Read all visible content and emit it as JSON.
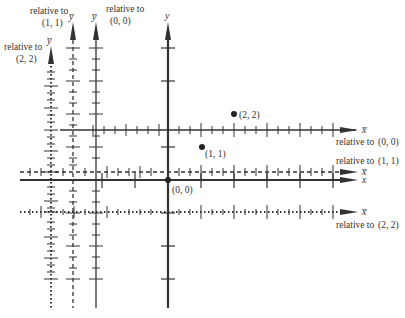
{
  "diagram": {
    "title": "",
    "origin_label": "(0, 0)",
    "points": [
      {
        "label": "(1, 1)",
        "x": 1,
        "y": 1
      },
      {
        "label": "(2, 2)",
        "x": 2,
        "y": 2
      }
    ],
    "main_axes": {
      "x_label": "x",
      "y_label": "y"
    },
    "relative_axes": [
      {
        "ref": "(0, 0)",
        "x_label": "x̅",
        "y_label": "y̅",
        "style": "solid-thin",
        "x_caption_a": "relative to",
        "x_caption_b": "(0, 0)",
        "y_caption_a": "relative to",
        "y_caption_b": "(0, 0)"
      },
      {
        "ref": "(1, 1)",
        "x_label": "x̅",
        "y_label": "y̅",
        "style": "dashed",
        "x_caption_a": "relative to",
        "x_caption_b": "(1, 1)",
        "y_caption_a": "relative to",
        "y_caption_b": "(1, 1)"
      },
      {
        "ref": "(2, 2)",
        "x_label": "x̅",
        "y_label": "y̅",
        "style": "dotted",
        "x_caption_a": "relative to",
        "x_caption_b": "(2, 2)",
        "y_caption_a": "relative to",
        "y_caption_b": "(2, 2)"
      }
    ],
    "colors": {
      "ink": "#333333",
      "background": "#ffffff"
    }
  }
}
